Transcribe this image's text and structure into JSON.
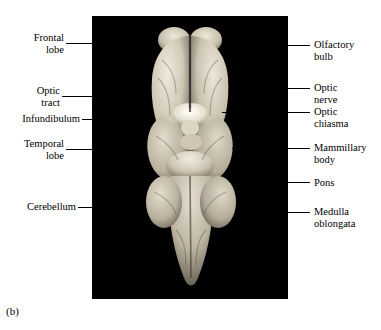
{
  "figure": {
    "caption": "(b)",
    "plate": {
      "background_color": "#000000",
      "subject": "ventral view of a sheep brain photograph"
    },
    "labels_left": [
      {
        "id": "frontal-lobe",
        "text": "Frontal\nlobe"
      },
      {
        "id": "optic-tract",
        "text": "Optic\ntract"
      },
      {
        "id": "infundibulum",
        "text": "Infundibulum"
      },
      {
        "id": "temporal-lobe",
        "text": "Temporal\nlobe"
      },
      {
        "id": "cerebellum",
        "text": "Cerebellum"
      }
    ],
    "labels_right": [
      {
        "id": "olfactory-bulb",
        "text": "Olfactory\nbulb"
      },
      {
        "id": "optic-nerve",
        "text": "Optic\nnerve"
      },
      {
        "id": "optic-chiasma",
        "text": "Optic\nchiasma"
      },
      {
        "id": "mammillary-body",
        "text": "Mammillary\nbody"
      },
      {
        "id": "pons",
        "text": "Pons"
      },
      {
        "id": "medulla-oblongata",
        "text": "Medulla\noblongata"
      }
    ]
  }
}
